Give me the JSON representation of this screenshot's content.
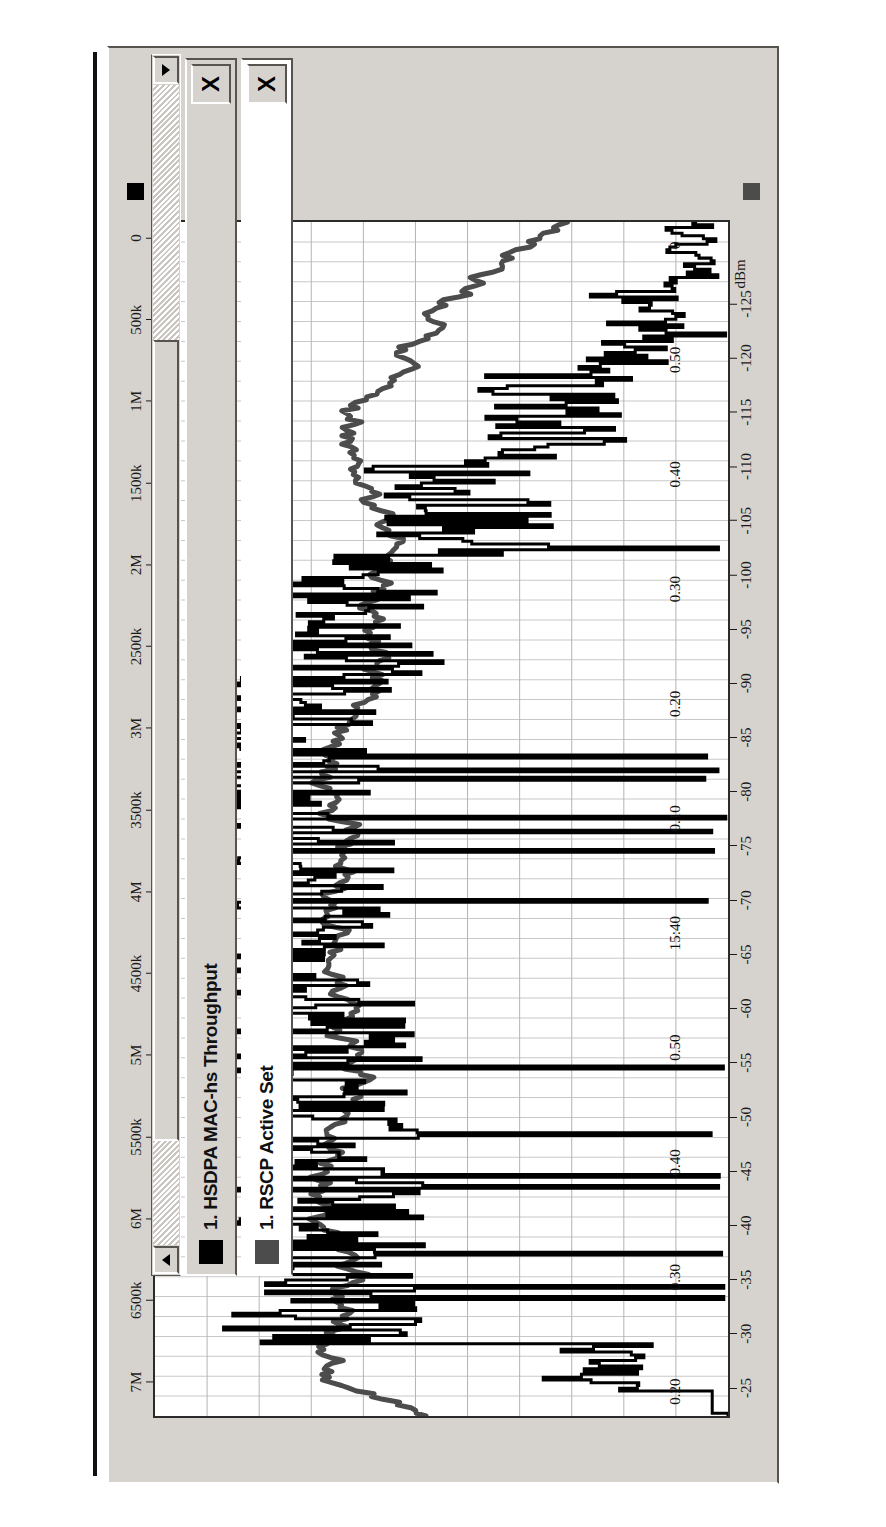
{
  "window": {
    "name": "chart-window",
    "background": "#d6d3ce"
  },
  "chart_data": {
    "type": "line",
    "title": "",
    "xlabel": "",
    "ylabel": "dBm",
    "orientation": "rotated-90-ccw",
    "grid": true,
    "legend_position": "bottom",
    "x": {
      "name": "time",
      "tick_labels": [
        "0.20",
        "0.30",
        "0.40",
        "0.50",
        "15:40",
        "0.10",
        "0.20",
        "0.30",
        "0.40",
        "0.50",
        "0"
      ],
      "minor_ticks_between": 4
    },
    "axes": [
      {
        "id": "throughput",
        "name": "HSDPA MAC-hs Throughput",
        "unit": "bit/s",
        "side": "top",
        "color": "#000000",
        "tick_labels": [
          "7M",
          "6500k",
          "6M",
          "5500k",
          "5M",
          "4500k",
          "4M",
          "3500k",
          "3M",
          "2500k",
          "2M",
          "1500k",
          "1M",
          "500k",
          "0"
        ],
        "values": [
          7000000,
          6500000,
          6000000,
          5500000,
          5000000,
          4500000,
          4000000,
          3500000,
          3000000,
          2500000,
          2000000,
          1500000,
          1000000,
          500000,
          0
        ],
        "range": [
          0,
          7250000
        ]
      },
      {
        "id": "rscp",
        "name": "RSCP Active Set",
        "unit": "dBm",
        "side": "bottom",
        "color": "#4c4c4c",
        "tick_labels": [
          "-25",
          "-30",
          "-35",
          "-40",
          "-45",
          "-50",
          "-55",
          "-60",
          "-65",
          "-70",
          "-75",
          "-80",
          "-85",
          "-90",
          "-95",
          "-100",
          "-105",
          "-110",
          "-115",
          "-120",
          "-125"
        ],
        "unit_label": "dBm",
        "values": [
          -25,
          -30,
          -35,
          -40,
          -45,
          -50,
          -55,
          -60,
          -65,
          -70,
          -75,
          -80,
          -85,
          -90,
          -95,
          -100,
          -105,
          -110,
          -115,
          -120,
          -125
        ],
        "range": [
          -22,
          -128
        ]
      }
    ],
    "series": [
      {
        "name": "1. HSDPA MAC-hs Throughput",
        "axis": "throughput",
        "color": "#000000",
        "style": "step",
        "marker": "black-square"
      },
      {
        "name": "1. RSCP Active Set",
        "axis": "rscp",
        "color": "#4c4c4c",
        "style": "line",
        "marker": "gray-square"
      }
    ]
  },
  "axis_markers": {
    "throughput_marker_color": "#000000",
    "rscp_marker_color": "#4c4c4c"
  },
  "legend": {
    "items": [
      {
        "index": "1.",
        "label": "1. HSDPA MAC-hs Throughput",
        "swatch": "#000000",
        "close_label": "X"
      },
      {
        "index": "1.",
        "label": "1. RSCP Active Set",
        "swatch": "#4c4c4c",
        "close_label": "X"
      }
    ]
  },
  "scrollbar": {
    "up_label": "▲",
    "down_label": "▼",
    "thumb_start_pct": 9,
    "thumb_size_pct": 69
  }
}
